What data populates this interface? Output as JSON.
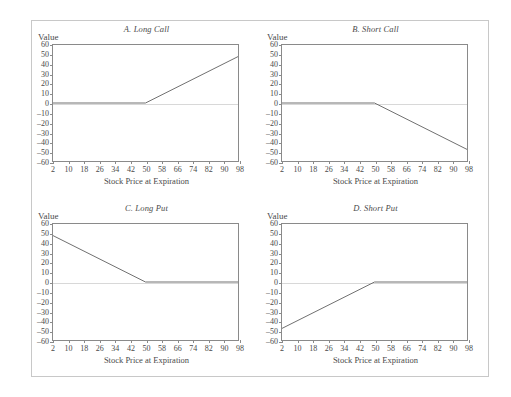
{
  "figure": {
    "name": "option-payoff-diagrams"
  },
  "axis": {
    "ylabel": "Value",
    "xlabel": "Stock Price at Expiration",
    "yticks": [
      "60",
      "50",
      "40",
      "30",
      "20",
      "10",
      "0",
      "–10",
      "–20",
      "–30",
      "–40",
      "–50",
      "–60"
    ],
    "ytick_values": [
      60,
      50,
      40,
      30,
      20,
      10,
      0,
      -10,
      -20,
      -30,
      -40,
      -50,
      -60
    ],
    "xticks": [
      "2",
      "10",
      "18",
      "26",
      "34",
      "42",
      "50",
      "58",
      "66",
      "74",
      "82",
      "90",
      "98"
    ],
    "xtick_values": [
      2,
      10,
      18,
      26,
      34,
      42,
      50,
      58,
      66,
      74,
      82,
      90,
      98
    ]
  },
  "colors": {
    "line": "#6e6e6e",
    "frame": "#8a8a8a",
    "zero": "#d8d8d8",
    "outer_frame": "#c8c8c8",
    "text": "#4a4a4a"
  },
  "panels": [
    {
      "id": "a",
      "title": "A. Long Call"
    },
    {
      "id": "b",
      "title": "B. Short Call"
    },
    {
      "id": "c",
      "title": "C. Long Put"
    },
    {
      "id": "d",
      "title": "D. Short Put"
    }
  ],
  "chart_data": [
    {
      "type": "line",
      "title": "A. Long Call",
      "xlabel": "Stock Price at Expiration",
      "ylabel": "Value",
      "xlim": [
        2,
        98
      ],
      "ylim": [
        -60,
        60
      ],
      "grid": false,
      "legend": "none",
      "strike": 50,
      "x": [
        2,
        50,
        98
      ],
      "y": [
        0,
        0,
        48
      ]
    },
    {
      "type": "line",
      "title": "B. Short Call",
      "xlabel": "Stock Price at Expiration",
      "ylabel": "Value",
      "xlim": [
        2,
        98
      ],
      "ylim": [
        -60,
        60
      ],
      "grid": false,
      "legend": "none",
      "strike": 50,
      "x": [
        2,
        50,
        98
      ],
      "y": [
        0,
        0,
        -48
      ]
    },
    {
      "type": "line",
      "title": "C. Long Put",
      "xlabel": "Stock Price at Expiration",
      "ylabel": "Value",
      "xlim": [
        2,
        98
      ],
      "ylim": [
        -60,
        60
      ],
      "grid": false,
      "legend": "none",
      "strike": 50,
      "x": [
        2,
        50,
        98
      ],
      "y": [
        48,
        0,
        0
      ]
    },
    {
      "type": "line",
      "title": "D. Short Put",
      "xlabel": "Stock Price at Expiration",
      "ylabel": "Value",
      "xlim": [
        2,
        98
      ],
      "ylim": [
        -60,
        60
      ],
      "grid": false,
      "legend": "none",
      "strike": 50,
      "x": [
        2,
        50,
        98
      ],
      "y": [
        -48,
        0,
        0
      ]
    }
  ]
}
